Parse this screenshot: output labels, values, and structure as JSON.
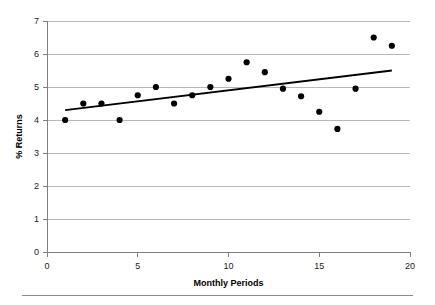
{
  "chart_data": {
    "type": "scatter",
    "title": "",
    "xlabel": "Monthly Periods",
    "ylabel": "% Returns",
    "xlim": [
      0,
      20
    ],
    "ylim": [
      0,
      7
    ],
    "xticks": [
      0,
      5,
      10,
      15,
      20
    ],
    "yticks": [
      0,
      1,
      2,
      3,
      4,
      5,
      6,
      7
    ],
    "xtick_labels": [
      "0",
      "5",
      "10",
      "15",
      "20"
    ],
    "ytick_labels": [
      "0",
      "1",
      "2",
      "3",
      "4",
      "5",
      "6",
      "7"
    ],
    "grid": "horizontal",
    "legend": "none",
    "x": [
      1,
      2,
      3,
      4,
      5,
      6,
      7,
      8,
      9,
      10,
      11,
      12,
      13,
      14,
      15,
      16,
      17,
      18,
      19
    ],
    "values": [
      4.0,
      4.5,
      4.5,
      4.0,
      4.75,
      5.0,
      4.5,
      4.75,
      5.0,
      5.25,
      5.75,
      5.45,
      4.95,
      4.72,
      4.25,
      3.73,
      4.95,
      6.5,
      6.25
    ],
    "series": [
      {
        "name": "Returns",
        "points": [
          {
            "x": 1,
            "y": 4.0
          },
          {
            "x": 2,
            "y": 4.5
          },
          {
            "x": 3,
            "y": 4.5
          },
          {
            "x": 4,
            "y": 4.0
          },
          {
            "x": 5,
            "y": 4.75
          },
          {
            "x": 6,
            "y": 5.0
          },
          {
            "x": 7,
            "y": 4.5
          },
          {
            "x": 8,
            "y": 4.75
          },
          {
            "x": 9,
            "y": 5.0
          },
          {
            "x": 10,
            "y": 5.25
          },
          {
            "x": 11,
            "y": 5.75
          },
          {
            "x": 12,
            "y": 5.45
          },
          {
            "x": 13,
            "y": 4.95
          },
          {
            "x": 14,
            "y": 4.72
          },
          {
            "x": 15,
            "y": 4.25
          },
          {
            "x": 16,
            "y": 3.73
          },
          {
            "x": 17,
            "y": 4.95
          },
          {
            "x": 18,
            "y": 6.5
          },
          {
            "x": 19,
            "y": 6.25
          }
        ]
      }
    ],
    "trend_line": {
      "name": "linear-trend",
      "x_start": 1,
      "y_start": 4.3,
      "x_end": 19,
      "y_end": 5.5
    }
  },
  "colors": {
    "point": "#000000",
    "trend": "#000000",
    "gridline": "#a6a6a6",
    "axis": "#7f7f7f",
    "text": "#000000",
    "background": "#ffffff"
  }
}
